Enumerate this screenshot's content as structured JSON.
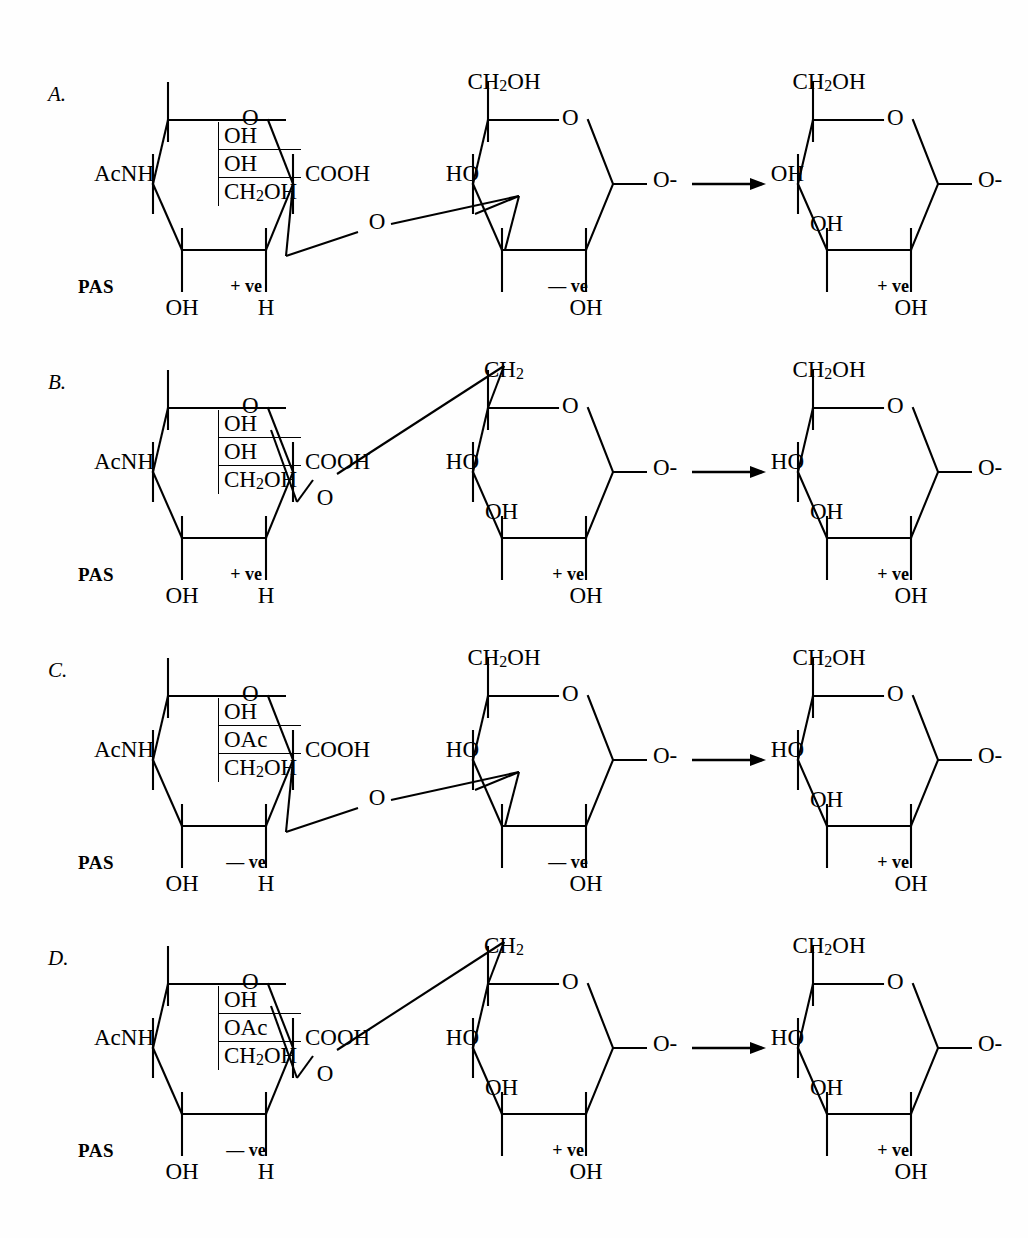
{
  "figure": {
    "type": "chemical-reaction-scheme",
    "arrow_glyph": "→"
  },
  "labels": {
    "pas": "PAS",
    "plus_ve": "+ ve",
    "minus_ve": "— ve",
    "acnh": "AcNH",
    "cooh": "COOH",
    "ch2oh": "CH2OH",
    "ch2": "CH2",
    "oh": "OH",
    "ho": "HO",
    "oac": "OAc",
    "h": "H",
    "o": "O",
    "o_minus": "O-"
  },
  "rows": [
    {
      "id": "A",
      "letter": "A.",
      "pas_label": "PAS",
      "left_ring": {
        "name": "N-acetyl-hexuronic-residue",
        "substituent_left": "AcNH",
        "stack": [
          "OH",
          "OH",
          "CH2OH"
        ],
        "right_group": "COOH",
        "bottom_left": "OH",
        "bottom_right": "H",
        "ring_oxygen": "O",
        "pas_result": "+ ve"
      },
      "linkage": {
        "style": "1-3",
        "atom": "O"
      },
      "middle_ring": {
        "name": "hexose-residue",
        "top": "CH2OH",
        "upper_left": "HO",
        "bottom": "OH",
        "right_group": "O-",
        "ring_oxygen": "O",
        "pas_result": "— ve"
      },
      "right_ring": {
        "name": "oxidised-hexose-residue",
        "top": "CH2OH",
        "upper_left": "OH",
        "lower_left": "OH",
        "bottom": "OH",
        "right_group": "O-",
        "ring_oxygen": "O",
        "pas_result": "+ ve"
      }
    },
    {
      "id": "B",
      "letter": "B.",
      "pas_label": "PAS",
      "left_ring": {
        "name": "N-acetyl-hexuronic-residue",
        "substituent_left": "AcNH",
        "stack": [
          "OH",
          "OH",
          "CH2OH"
        ],
        "right_group": "COOH",
        "bottom_left": "OH",
        "bottom_right": "H",
        "ring_oxygen": "O",
        "pas_result": "+ ve"
      },
      "linkage": {
        "style": "1-6",
        "atom": "O"
      },
      "middle_ring": {
        "name": "hexose-residue",
        "top": "CH2",
        "upper_left": "HO",
        "lower_left": "OH",
        "bottom": "OH",
        "right_group": "O-",
        "ring_oxygen": "O",
        "pas_result": "+ ve"
      },
      "right_ring": {
        "name": "oxidised-hexose-residue",
        "top": "CH2OH",
        "upper_left": "HO",
        "lower_left": "OH",
        "bottom": "OH",
        "right_group": "O-",
        "ring_oxygen": "O",
        "pas_result": "+ ve"
      }
    },
    {
      "id": "C",
      "letter": "C.",
      "pas_label": "PAS",
      "left_ring": {
        "name": "N-acetyl-hexuronic-residue",
        "substituent_left": "AcNH",
        "stack": [
          "OH",
          "OAc",
          "CH2OH"
        ],
        "right_group": "COOH",
        "bottom_left": "OH",
        "bottom_right": "H",
        "ring_oxygen": "O",
        "pas_result": "— ve"
      },
      "linkage": {
        "style": "1-3",
        "atom": "O"
      },
      "middle_ring": {
        "name": "hexose-residue",
        "top": "CH2OH",
        "upper_left": "HO",
        "bottom": "OH",
        "right_group": "O-",
        "ring_oxygen": "O",
        "pas_result": "— ve"
      },
      "right_ring": {
        "name": "oxidised-hexose-residue",
        "top": "CH2OH",
        "upper_left": "HO",
        "lower_left": "OH",
        "bottom": "OH",
        "right_group": "O-",
        "ring_oxygen": "O",
        "pas_result": "+ ve"
      }
    },
    {
      "id": "D",
      "letter": "D.",
      "pas_label": "PAS",
      "left_ring": {
        "name": "N-acetyl-hexuronic-residue",
        "substituent_left": "AcNH",
        "stack": [
          "OH",
          "OAc",
          "CH2OH"
        ],
        "right_group": "COOH",
        "bottom_left": "OH",
        "bottom_right": "H",
        "ring_oxygen": "O",
        "pas_result": "— ve"
      },
      "linkage": {
        "style": "1-6",
        "atom": "O"
      },
      "middle_ring": {
        "name": "hexose-residue",
        "top": "CH2",
        "upper_left": "HO",
        "lower_left": "OH",
        "bottom": "OH",
        "right_group": "O-",
        "ring_oxygen": "O",
        "pas_result": "+ ve"
      },
      "right_ring": {
        "name": "oxidised-hexose-residue",
        "top": "CH2OH",
        "upper_left": "HO",
        "lower_left": "OH",
        "bottom": "OH",
        "right_group": "O-",
        "ring_oxygen": "O",
        "pas_result": "+ ve"
      }
    }
  ]
}
